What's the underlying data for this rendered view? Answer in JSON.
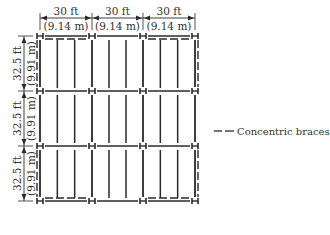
{
  "diagram": {
    "bays_x": [
      {
        "ft": "30 ft",
        "m": "(9.14 m)"
      },
      {
        "ft": "30 ft",
        "m": "(9.14 m)"
      },
      {
        "ft": "30 ft",
        "m": "(9.14 m)"
      }
    ],
    "bays_y": [
      {
        "ft": "32.5 ft",
        "m": "(9.91 m)"
      },
      {
        "ft": "32.5 ft",
        "m": "(9.91 m)"
      },
      {
        "ft": "32.5 ft",
        "m": "(9.91 m)"
      }
    ],
    "joists_per_bay": 2,
    "braced_frames": {
      "horizontal": [
        {
          "gridline_row": 0,
          "bay": 0
        },
        {
          "gridline_row": 0,
          "bay": 2
        },
        {
          "gridline_row": 3,
          "bay": 0
        },
        {
          "gridline_row": 3,
          "bay": 2
        }
      ],
      "vertical": [
        {
          "gridline_col": 0,
          "bay": 0
        },
        {
          "gridline_col": 0,
          "bay": 2
        },
        {
          "gridline_col": 3,
          "bay": 0
        },
        {
          "gridline_col": 3,
          "bay": 2
        }
      ]
    },
    "legend": {
      "brace_label": "Concentric braces",
      "line_color": "#2a2a2a"
    },
    "colors": {
      "line": "#2a2a2a",
      "text": "#333333",
      "background": "#ffffff"
    }
  }
}
